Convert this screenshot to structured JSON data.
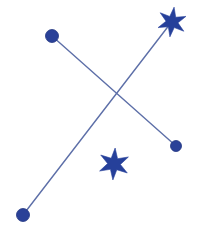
{
  "canvas": {
    "width": 201,
    "height": 235,
    "background_color": "#ffffff",
    "title": "Constellation Diagram"
  },
  "style": {
    "marker_fill": "#2a4198",
    "marker_stroke": "#1f3480",
    "line_color": "#5d6fa8",
    "line_width": 1.4,
    "star_fill": "#26409a"
  },
  "chart_data": {
    "type": "scatter",
    "title": "",
    "xlabel": "",
    "ylabel": "",
    "xlim": [
      0,
      201
    ],
    "ylim": [
      0,
      235
    ],
    "grid": false,
    "legend": null,
    "points": [
      {
        "id": "p1",
        "label": "top-left circle",
        "marker": "circle",
        "x": 52,
        "y": 36,
        "radius": 6.5
      },
      {
        "id": "p2",
        "label": "right circle",
        "marker": "circle",
        "x": 176,
        "y": 146,
        "radius": 5.5
      },
      {
        "id": "p3",
        "label": "bottom-left circle",
        "marker": "circle",
        "x": 23,
        "y": 215,
        "radius": 6.5
      },
      {
        "id": "p4",
        "label": "top-right star",
        "marker": "star",
        "x": 172,
        "y": 22,
        "radius": 15,
        "points": 6,
        "rotation": 8
      },
      {
        "id": "p5",
        "label": "center star",
        "marker": "star",
        "x": 114,
        "y": 164,
        "radius": 16,
        "points": 6,
        "rotation": 4
      }
    ],
    "segments": [
      {
        "id": "s1",
        "label": "top-left to right",
        "from": "p1",
        "to": "p2",
        "x1": 52,
        "y1": 36,
        "x2": 176,
        "y2": 146
      },
      {
        "id": "s2",
        "label": "bottom-left to top-right star",
        "from": "p3",
        "to": "p4",
        "x1": 23,
        "y1": 215,
        "x2": 170,
        "y2": 24
      }
    ],
    "intersection": {
      "x": 119,
      "y": 97
    }
  }
}
